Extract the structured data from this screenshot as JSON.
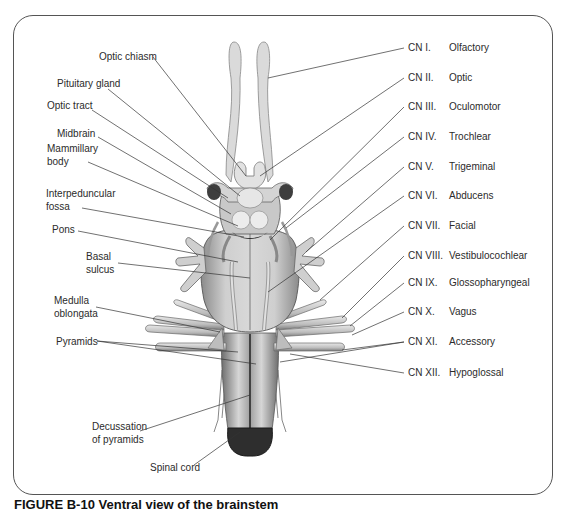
{
  "figure": {
    "caption": "FIGURE B-10  Ventral view of the brainstem",
    "left_labels": [
      {
        "id": "optic-chiasm",
        "text": "Optic chiasm",
        "x": 99,
        "y": 50
      },
      {
        "id": "pituitary-gland",
        "text": "Pituitary gland",
        "x": 57,
        "y": 77
      },
      {
        "id": "optic-tract",
        "text": "Optic tract",
        "x": 47,
        "y": 99
      },
      {
        "id": "midbrain",
        "text": "Midbrain",
        "x": 57,
        "y": 127
      },
      {
        "id": "mammillary-body",
        "text": "Mammillary\nbody",
        "line1": "Mammillary",
        "line2": "body",
        "x": 47,
        "y": 148
      },
      {
        "id": "interpeduncular-fossa",
        "text": "Interpeduncular\nfossa",
        "line1": "Interpeduncular",
        "line2": "fossa",
        "x": 46,
        "y": 187
      },
      {
        "id": "pons",
        "text": "Pons",
        "x": 52,
        "y": 223
      },
      {
        "id": "basal-sulcus",
        "text": "Basal\nsulcus",
        "line1": "Basal",
        "line2": "sulcus",
        "x": 86,
        "y": 250
      },
      {
        "id": "medulla-oblongata",
        "text": "Medulla\noblongata",
        "line1": "Medulla",
        "line2": "oblongata",
        "x": 54,
        "y": 294
      },
      {
        "id": "pyramids",
        "text": "Pyramids",
        "x": 56,
        "y": 335
      },
      {
        "id": "decussation-of-pyramids",
        "text": "Decussation\nof pyramids",
        "line1": "Decussation",
        "line2": "of pyramids",
        "x": 92,
        "y": 420
      },
      {
        "id": "spinal-cord",
        "text": "Spinal cord",
        "x": 150,
        "y": 461
      }
    ],
    "cranial_nerves": [
      {
        "number": "CN I.",
        "name": "Olfactory",
        "y": 42
      },
      {
        "number": "CN II.",
        "name": "Optic",
        "y": 72
      },
      {
        "number": "CN III.",
        "name": "Oculomotor",
        "y": 101
      },
      {
        "number": "CN IV.",
        "name": "Trochlear",
        "y": 131
      },
      {
        "number": "CN V.",
        "name": "Trigeminal",
        "y": 161
      },
      {
        "number": "CN VI.",
        "name": "Abducens",
        "y": 190
      },
      {
        "number": "CN VII.",
        "name": "Facial",
        "y": 220
      },
      {
        "number": "CN VIII.",
        "name": "Vestibulocochlear",
        "y": 250
      },
      {
        "number": "CN IX.",
        "name": "Glossopharyngeal",
        "y": 277
      },
      {
        "number": "CN X.",
        "name": "Vagus",
        "y": 306
      },
      {
        "number": "CN XI.",
        "name": "Accessory",
        "y": 336
      },
      {
        "number": "CN XII.",
        "name": "Hypoglossal",
        "y": 367
      }
    ],
    "colors": {
      "frame": "#555555",
      "leader": "#333333",
      "tissue_light": "#e4e4e4",
      "tissue_mid": "#b9b9b9",
      "tissue_dark": "#3a3a3a",
      "text": "#2b2b2b"
    }
  }
}
